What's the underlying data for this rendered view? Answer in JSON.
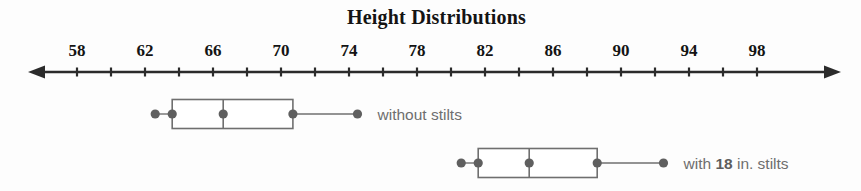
{
  "chart_data": {
    "type": "box",
    "title": "Height Distributions",
    "xlabel": "",
    "ylabel": "",
    "xlim": [
      56,
      100
    ],
    "grid": false,
    "legend_position": "right-of-plot",
    "axis": {
      "tick_step": 2,
      "label_step": 4,
      "arrow_left": true,
      "arrow_right": true,
      "tick_values": [
        58,
        60,
        62,
        64,
        66,
        68,
        70,
        72,
        74,
        76,
        78,
        80,
        82,
        84,
        86,
        88,
        90,
        92,
        94,
        96,
        98
      ],
      "tick_labels": [
        "58",
        "",
        "62",
        "",
        "66",
        "",
        "70",
        "",
        "74",
        "",
        "78",
        "",
        "82",
        "",
        "86",
        "",
        "90",
        "",
        "94",
        "",
        "98"
      ]
    },
    "series": [
      {
        "name": "without stilts",
        "label": "without stilts",
        "min": 62.6,
        "q1": 63.6,
        "median": 66.6,
        "q3": 70.7,
        "max": 74.5,
        "markers": [
          62.6,
          63.6,
          66.6,
          70.7,
          74.5
        ]
      },
      {
        "name": "with 18 in. stilts",
        "label": "with 18 in. stilts",
        "label_parts": [
          {
            "text": "with ",
            "bold": false
          },
          {
            "text": "18",
            "bold": true
          },
          {
            "text": " in. stilts",
            "bold": false
          }
        ],
        "min": 80.6,
        "q1": 81.6,
        "median": 84.6,
        "q3": 88.6,
        "max": 92.5,
        "markers": [
          80.6,
          81.6,
          84.6,
          88.6,
          92.5
        ]
      }
    ]
  },
  "colors": {
    "background": "#fdfdfd",
    "axis": "#2b2b2b",
    "title_text": "#141414",
    "tick_text": "#141414",
    "box_stroke": "#6f6f6f",
    "box_fill": "#ffffff",
    "marker": "#5f5f5f",
    "series_label_text": "#6e6e6e"
  }
}
